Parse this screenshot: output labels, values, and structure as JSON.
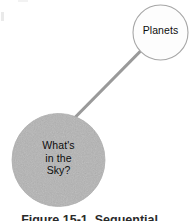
{
  "figure": {
    "kind": "concept-map",
    "background_color": "#ffffff",
    "width": 193,
    "height": 221
  },
  "nodes": [
    {
      "id": "planets",
      "label": "Planets",
      "shape": "circle",
      "cx": 160.5,
      "cy": 32.5,
      "r": 27.5,
      "fill": "#fdfdfd",
      "stroke": "#a6a6a6",
      "stroke_width": 1.1,
      "text_color": "#0d0d0d"
    },
    {
      "id": "whats-in-the-sky",
      "label": "What's\nin the\nSky?",
      "label_lines": [
        "What's",
        "in the",
        "Sky?"
      ],
      "shape": "circle",
      "cx": 58.5,
      "cy": 160,
      "r": 46.5,
      "fill": "#b4b4b4",
      "stroke": "#adadad",
      "stroke_width": 0.8,
      "text_color": "#0d0d0d"
    }
  ],
  "connectors": [
    {
      "id": "sky-to-planets",
      "from": "whats-in-the-sky",
      "to": "planets",
      "x1": 72,
      "y1": 120.5,
      "x2": 147,
      "y2": 44.5,
      "color": "#9a9a9a",
      "width": 3.2
    }
  ],
  "caption": {
    "text": "Figure 15-1.  Sequential ...",
    "clipped": true,
    "note": "caption is cut off by the bottom edge of the screenshot"
  },
  "colors": {
    "page_background": "#ffffff",
    "node_gray_fill": "#b4b4b4",
    "node_white_fill": "#fdfdfd",
    "connector_gray": "#9a9a9a",
    "text_black": "#0d0d0d",
    "caption_gray": "#2a2a2a"
  }
}
